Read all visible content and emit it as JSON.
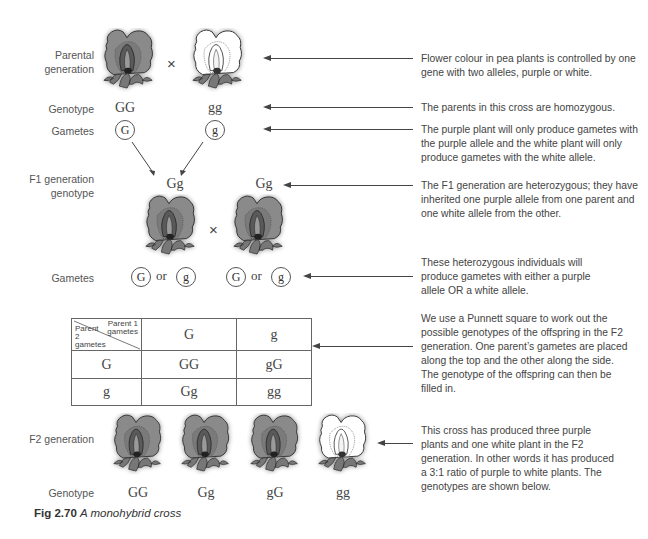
{
  "colors": {
    "purple_petal": "#8a8a8a",
    "purple_petal_dark": "#6e6e6e",
    "white_petal": "#ffffff",
    "outline": "#333333",
    "leaf": "#777777",
    "text": "#444444"
  },
  "rows": {
    "parental_label": "Parental generation",
    "genotype_label": "Genotype",
    "gametes_label": "Gametes",
    "f1_label": "F1 generation genotype",
    "f1_gametes_label": "Gametes",
    "f2_label": "F2 generation",
    "f2_genotype_label": "Genotype"
  },
  "parents": {
    "cross_symbol": "×",
    "plants": [
      {
        "colour": "purple",
        "genotype": "GG",
        "gamete": "G"
      },
      {
        "colour": "white",
        "genotype": "gg",
        "gamete": "g"
      }
    ]
  },
  "f1": {
    "cross_symbol": "×",
    "or_word": "or",
    "plants": [
      {
        "colour": "purple",
        "genotype": "Gg",
        "gametes": [
          "G",
          "g"
        ]
      },
      {
        "colour": "purple",
        "genotype": "Gg",
        "gametes": [
          "G",
          "g"
        ]
      }
    ]
  },
  "punnett": {
    "corner_top": "Parent 1 gametes",
    "corner_bottom": "Parent 2 gametes",
    "col_headers": [
      "G",
      "g"
    ],
    "rows": [
      {
        "header": "G",
        "cells": [
          "GG",
          "gG"
        ]
      },
      {
        "header": "g",
        "cells": [
          "Gg",
          "gg"
        ]
      }
    ]
  },
  "f2": {
    "plants": [
      {
        "colour": "purple",
        "genotype": "GG"
      },
      {
        "colour": "purple",
        "genotype": "Gg"
      },
      {
        "colour": "purple",
        "genotype": "gG"
      },
      {
        "colour": "white",
        "genotype": "gg"
      }
    ]
  },
  "notes": [
    "Flower colour in pea plants is controlled by one gene with two alleles, purple or white.",
    "The parents in this cross are homozygous.",
    "The purple plant will only produce gametes with the purple allele and the white plant will only produce gametes with the white allele.",
    "The F1 generation are heterozygous; they have inherited one purple allele from one parent and one white allele from the other.",
    "These heterozygous individuals will produce gametes with either a purple allele OR a white allele.",
    "We use a Punnett square to work out the possible genotypes of the offspring in the F2 generation. One parent’s gametes are placed along the top and the other along the side. The genotype of the offspring can then be filled in.",
    "This cross has produced three purple plants and one white plant in the F2 generation. In other words it has produced a 3:1 ratio of purple to white plants. The genotypes are shown below."
  ],
  "caption": {
    "number": "Fig 2.70",
    "title": "A monohybrid cross"
  }
}
